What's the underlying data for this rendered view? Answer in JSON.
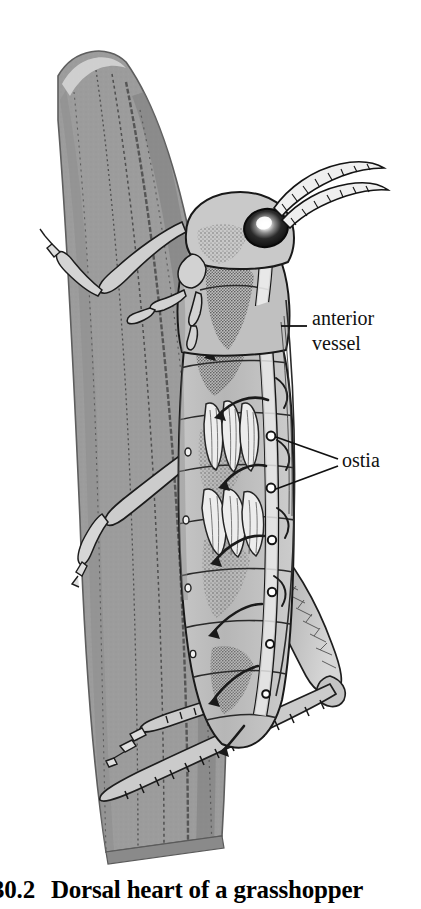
{
  "figure": {
    "caption": {
      "number": "30.2",
      "text": "Dorsal heart of a grasshopper"
    },
    "labels": [
      {
        "id": "anterior-vessel",
        "line1": "anterior",
        "line2": "vessel"
      },
      {
        "id": "ostia",
        "line1": "ostia",
        "line2": ""
      }
    ],
    "colors": {
      "leaf_fill": "#9c9c9c",
      "leaf_edge": "#6f6f6f",
      "body_fill": "#b9b9b9",
      "body_light": "#d2d2d2",
      "body_highlight": "#e6e6e6",
      "outline": "#1a1a1a",
      "eye_dark": "#141414",
      "eye_highlight": "#ffffff",
      "vessel_fill": "#e8e8e8",
      "paper": "#ffffff",
      "leader_line": "#111111"
    }
  }
}
